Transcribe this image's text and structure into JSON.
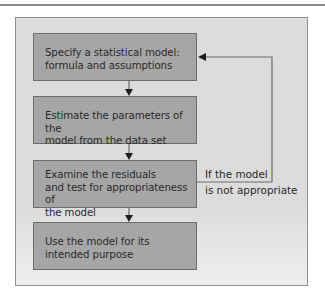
{
  "diagram": {
    "type": "flowchart",
    "colors": {
      "panel": "#dcdcdc",
      "box": "#a6a6a6",
      "line": "#6d6d6d",
      "text": "#2a2a2a"
    },
    "steps": [
      {
        "id": "specify",
        "label": "Specify a statistical model:\nformula and assumptions"
      },
      {
        "id": "estimate",
        "label": "Estimate the parameters of the\nmodel from the data set"
      },
      {
        "id": "examine",
        "label": "Examine the residuals\nand test for appropriateness of\nthe model"
      },
      {
        "id": "use",
        "label": "Use the model for its\nintended purpose"
      }
    ],
    "feedback": {
      "from": "examine",
      "to": "specify",
      "label_line1": "If the model",
      "label_line2": "is not appropriate"
    }
  }
}
